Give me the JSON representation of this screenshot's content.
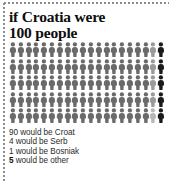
{
  "title": {
    "line1": "if Croatia were",
    "line2": "100 people"
  },
  "legend": [
    {
      "count": "90",
      "text": " would be Croat",
      "color": "#6a6a6a",
      "bold": false
    },
    {
      "count": "4",
      "text": " would be Serb",
      "color": "#9a9a9a",
      "bold": false
    },
    {
      "count": "1",
      "text": " would be Bosniak",
      "color": "#b8b8b8",
      "bold": false
    },
    {
      "count": "5",
      "text": " would be other",
      "color": "#1a1a1a",
      "bold": true
    }
  ],
  "chart_data": {
    "type": "pictogram",
    "title": "if Croatia were 100 people",
    "unit_label": "person",
    "total": 100,
    "columns": 20,
    "rows": 5,
    "categories": [
      "Croat",
      "Serb",
      "Bosniak",
      "other"
    ],
    "values": [
      90,
      4,
      1,
      5
    ],
    "colors": [
      "#6a6a6a",
      "#9a9a9a",
      "#b8b8b8",
      "#1a1a1a"
    ],
    "annotations": [
      "90 would be Croat",
      "4 would be Serb",
      "1 would be Bosniak",
      "5 would be other"
    ],
    "legend_position": "below",
    "grid": false
  }
}
